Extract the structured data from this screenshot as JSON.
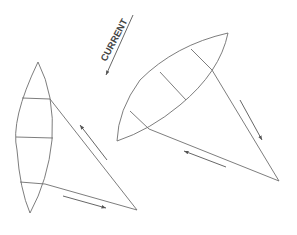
{
  "diagram": {
    "label": "CURRENT",
    "colors": {
      "stroke": "#6e6e6e",
      "background": "#ffffff"
    },
    "elements": [
      {
        "name": "current-arrow",
        "direction": "down-left"
      },
      {
        "name": "left-sail-hull",
        "type": "kite-shape",
        "sections": 4
      },
      {
        "name": "right-sail-hull",
        "type": "kite-shape",
        "sections": 4
      },
      {
        "name": "left-rope-triangle",
        "arrows": [
          "up-left",
          "right"
        ]
      },
      {
        "name": "right-rope-triangle",
        "arrows": [
          "down-right",
          "left"
        ]
      }
    ]
  }
}
